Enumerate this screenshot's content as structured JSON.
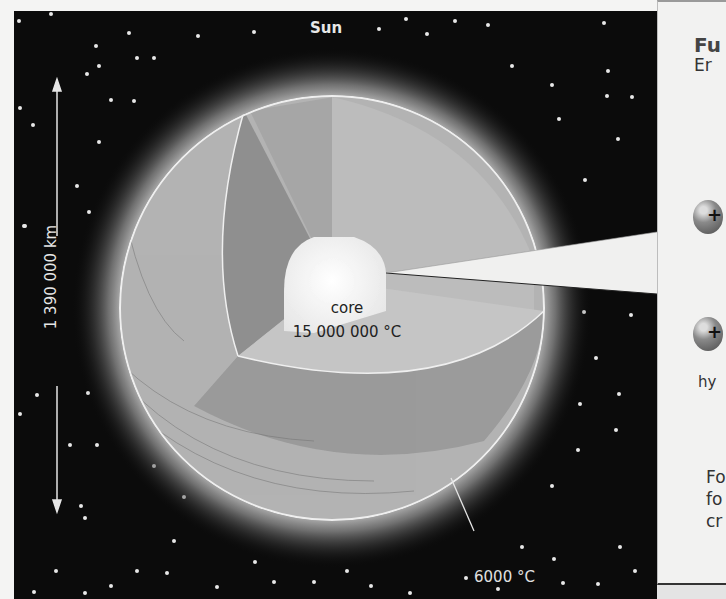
{
  "diagram": {
    "title": "Sun",
    "diameter_label": "1 390 000 km",
    "core": {
      "name": "core",
      "temperature": "15 000 000 °C"
    },
    "surface_temperature": "6000 °C"
  },
  "side_panel": {
    "title_partial": "Fu",
    "subtitle_partial": "Er",
    "particle_symbol": "+",
    "particle_label_partial": "hy",
    "text_lines_partial": [
      "Fo",
      "fo",
      "cr"
    ]
  },
  "colors": {
    "space": "#0b0b0b",
    "sphere_outer": "#b4b4b4",
    "cut_face": "#8f8f8f",
    "core": "#f2f2f2",
    "panel": "#f2f2f1"
  }
}
